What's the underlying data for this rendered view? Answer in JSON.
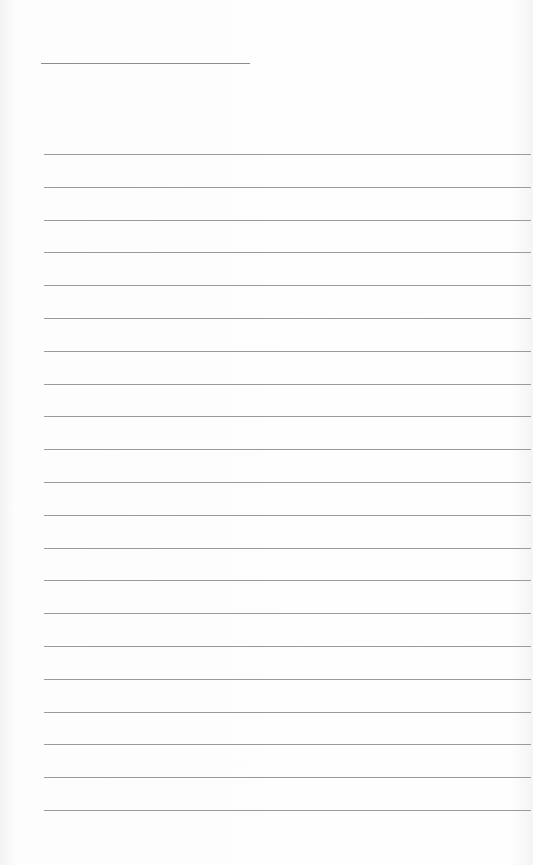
{
  "page": {
    "type": "lined-paper",
    "title_line": {
      "x": 41,
      "y": 63,
      "width": 209
    },
    "rule_count": 21,
    "first_rule_y": 154,
    "rule_spacing": 32.8,
    "rules": [
      {
        "index": 1,
        "text": ""
      },
      {
        "index": 2,
        "text": ""
      },
      {
        "index": 3,
        "text": ""
      },
      {
        "index": 4,
        "text": ""
      },
      {
        "index": 5,
        "text": ""
      },
      {
        "index": 6,
        "text": ""
      },
      {
        "index": 7,
        "text": ""
      },
      {
        "index": 8,
        "text": ""
      },
      {
        "index": 9,
        "text": ""
      },
      {
        "index": 10,
        "text": ""
      },
      {
        "index": 11,
        "text": ""
      },
      {
        "index": 12,
        "text": ""
      },
      {
        "index": 13,
        "text": ""
      },
      {
        "index": 14,
        "text": ""
      },
      {
        "index": 15,
        "text": ""
      },
      {
        "index": 16,
        "text": ""
      },
      {
        "index": 17,
        "text": ""
      },
      {
        "index": 18,
        "text": ""
      },
      {
        "index": 19,
        "text": ""
      },
      {
        "index": 20,
        "text": ""
      },
      {
        "index": 21,
        "text": ""
      }
    ],
    "colors": {
      "paper": "#fefefe",
      "rule": "#9a9a9a",
      "title_rule": "#8d8d8d"
    }
  }
}
